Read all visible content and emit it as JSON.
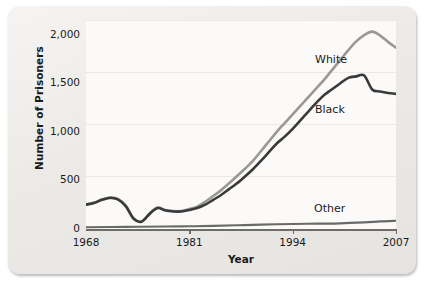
{
  "chart_data": {
    "type": "line",
    "title": "",
    "xlabel": "Year",
    "ylabel": "Number of Prisoners",
    "xlim": [
      1968,
      2007
    ],
    "ylim": [
      0,
      2150
    ],
    "xticks": [
      1968,
      1981,
      1994,
      2007
    ],
    "xtick_labels": [
      "1968",
      "1981",
      "1994",
      "2007"
    ],
    "yticks": [
      0,
      500,
      1000,
      1500,
      2000
    ],
    "ytick_labels": [
      "0",
      "500",
      "1,000",
      "1,500",
      "2,000"
    ],
    "grid": true,
    "legend_position": "inline-annotations",
    "series": [
      {
        "name": "White",
        "color": "#9a9893",
        "annotation_label": "White",
        "x": [
          1968,
          1969,
          1970,
          1971,
          1972,
          1973,
          1974,
          1975,
          1976,
          1977,
          1978,
          1979,
          1980,
          1981,
          1982,
          1983,
          1984,
          1985,
          1986,
          1987,
          1988,
          1989,
          1990,
          1991,
          1992,
          1993,
          1994,
          1995,
          1996,
          1997,
          1998,
          1999,
          2000,
          2001,
          2002,
          2003,
          2004,
          2005,
          2006,
          2007
        ],
        "values": [
          255,
          270,
          300,
          320,
          310,
          240,
          110,
          80,
          160,
          220,
          195,
          185,
          185,
          205,
          230,
          280,
          340,
          400,
          470,
          545,
          620,
          700,
          800,
          900,
          1000,
          1090,
          1180,
          1270,
          1360,
          1450,
          1540,
          1640,
          1740,
          1840,
          1930,
          1995,
          2030,
          1990,
          1925,
          1865
        ]
      },
      {
        "name": "Black",
        "color": "#3a3a3a",
        "annotation_label": "Black",
        "x": [
          1968,
          1969,
          1970,
          1971,
          1972,
          1973,
          1974,
          1975,
          1976,
          1977,
          1978,
          1979,
          1980,
          1981,
          1982,
          1983,
          1984,
          1985,
          1986,
          1987,
          1988,
          1989,
          1990,
          1991,
          1992,
          1993,
          1994,
          1995,
          1996,
          1997,
          1998,
          1999,
          2000,
          2001,
          2002,
          2003,
          2004,
          2005,
          2006,
          2007
        ],
        "values": [
          250,
          268,
          300,
          322,
          305,
          235,
          105,
          75,
          155,
          215,
          190,
          180,
          180,
          195,
          215,
          250,
          300,
          350,
          410,
          470,
          540,
          615,
          700,
          790,
          880,
          950,
          1030,
          1120,
          1210,
          1300,
          1380,
          1440,
          1500,
          1555,
          1570,
          1580,
          1435,
          1415,
          1400,
          1390
        ]
      },
      {
        "name": "Other",
        "color": "#6a6a6a",
        "annotation_label": "Other",
        "x": [
          1968,
          1973,
          1978,
          1981,
          1984,
          1987,
          1990,
          1994,
          1997,
          2000,
          2003,
          2005,
          2007
        ],
        "values": [
          18,
          22,
          25,
          28,
          32,
          38,
          45,
          52,
          55,
          58,
          68,
          78,
          85
        ]
      }
    ],
    "annotations": [
      {
        "text": "White",
        "x_px": 307,
        "y_px": 47
      },
      {
        "text": "Black",
        "x_px": 307,
        "y_px": 97
      },
      {
        "text": "Other",
        "x_px": 306,
        "y_px": 196
      }
    ]
  }
}
